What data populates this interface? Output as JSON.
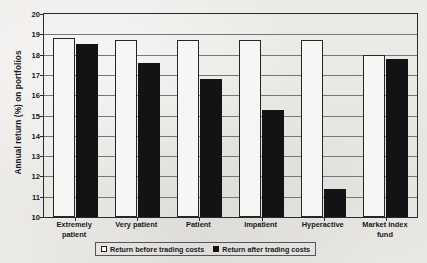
{
  "chart_data": {
    "type": "bar",
    "title": "",
    "xlabel": "",
    "ylabel": "Annual return (%) on portfolios",
    "ylim": [
      10,
      20
    ],
    "ytick_labels": [
      "10",
      "11",
      "12",
      "13",
      "14",
      "15",
      "16",
      "17",
      "18",
      "19",
      "20"
    ],
    "yticks": [
      10,
      11,
      12,
      13,
      14,
      15,
      16,
      17,
      18,
      19,
      20
    ],
    "grid": true,
    "legend_position": "bottom",
    "categories": [
      "Extremely patient",
      "Very patient",
      "Patient",
      "Impatient",
      "Hyperactive",
      "Market index fund"
    ],
    "category_lines": [
      [
        "Extremely",
        "patient"
      ],
      [
        "Very patient"
      ],
      [
        "Patient"
      ],
      [
        "Impatient"
      ],
      [
        "Hyperactive"
      ],
      [
        "Market index",
        "fund"
      ]
    ],
    "series": [
      {
        "name": "Return before trading costs",
        "color": "#f7f6f4",
        "values": [
          18.8,
          18.7,
          18.7,
          18.7,
          18.7,
          18.0
        ]
      },
      {
        "name": "Return after trading costs",
        "color": "#131316",
        "values": [
          18.5,
          17.6,
          16.8,
          15.25,
          11.4,
          17.8
        ]
      }
    ]
  },
  "legend": {
    "items": [
      {
        "label": "Return before trading costs",
        "swatch": "before"
      },
      {
        "label": "Return after trading costs",
        "swatch": "after"
      }
    ]
  }
}
